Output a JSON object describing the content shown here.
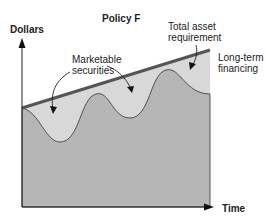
{
  "title": "Policy F",
  "axes": {
    "ylabel": "Dollars",
    "xlabel": "Time"
  },
  "annotations": {
    "marketable_1": "Marketable",
    "marketable_2": "securities",
    "total_1": "Total asset",
    "total_2": "requirement",
    "longterm_1": "Long-term",
    "longterm_2": "financing"
  },
  "colors": {
    "light_fill": "#d6d6d6",
    "dark_fill": "#b4b4b4",
    "financing_line": "#555555",
    "axis": "#222222"
  }
}
